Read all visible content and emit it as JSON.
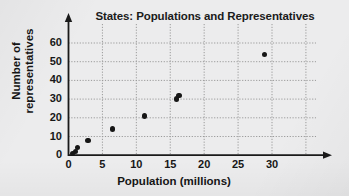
{
  "chart_data": {
    "type": "scatter",
    "title": "States: Populations and Representatives",
    "xlabel": "Population (millions)",
    "ylabel": "Number of representatives",
    "ylabel_lines": [
      "Number of",
      "representatives"
    ],
    "xlim": [
      0,
      33
    ],
    "ylim": [
      0,
      66
    ],
    "xticks": [
      0,
      5,
      10,
      15,
      20,
      25,
      30
    ],
    "xtick_labels": [
      "0",
      "5",
      "10",
      "15",
      "20",
      "25",
      "30"
    ],
    "yticks": [
      0,
      10,
      20,
      30,
      40,
      50,
      60
    ],
    "ytick_labels": [
      "0",
      "10",
      "20",
      "30",
      "40",
      "50",
      "60"
    ],
    "grid": true,
    "grid_style": "dotted",
    "legend": null,
    "marker_color": "#161616",
    "grid_color": "#9a9a9a",
    "axis_color": "#1a1a1a",
    "background_color": "#ececed",
    "x": [
      0.6,
      1.0,
      1.3,
      2.9,
      6.5,
      11.2,
      15.9,
      16.3,
      28.9
    ],
    "y": [
      1,
      2,
      4,
      8,
      14,
      21,
      30,
      32,
      54
    ],
    "points": [
      {
        "x": 0.6,
        "y": 1
      },
      {
        "x": 1.0,
        "y": 2
      },
      {
        "x": 1.3,
        "y": 4
      },
      {
        "x": 2.9,
        "y": 8
      },
      {
        "x": 6.5,
        "y": 14
      },
      {
        "x": 11.2,
        "y": 21
      },
      {
        "x": 15.9,
        "y": 30
      },
      {
        "x": 16.3,
        "y": 32
      },
      {
        "x": 28.9,
        "y": 54
      }
    ]
  }
}
